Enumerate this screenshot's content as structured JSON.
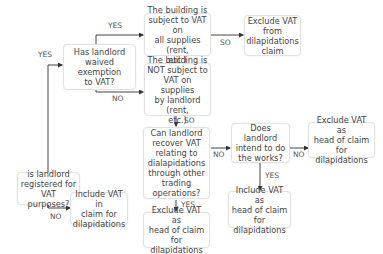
{
  "nodes": {
    "registered": "is landlord\nregistered for\nVAT purposes?",
    "waived": "Has landlord\nwaived exemption\nto VAT?",
    "subject": "The building is\nsubject to VAT on\nall supplies (rent,\netc.)",
    "exclude_from_claim": "Exclude VAT\nfrom\ndilapidations\nclaim",
    "not_subject": "The building is\nNOT subject to\nVAT on supplies\nby landlord (rent,\netc.)",
    "recover": "Can landlord\nrecover VAT\nrelating to\ndialapidations\nthrough other\ntrading\noperations?",
    "intend": "Does landlord\nintend to do\nthe works?",
    "exclude_head_no": "Exclude VAT as\nhead of claim\nfor dilapidations",
    "include_head": "Include VAT as\nhead of claim\nfor dilapidations",
    "exclude_head_yes": "Exclude VAT as\nhead of claim for\ndilapidations",
    "include_claim": "Include VAT in\nclaim for\ndilapidations"
  },
  "labels": {
    "yes_registered": "YES",
    "no_registered": "NO",
    "yes_waived": "YES",
    "no_waived": "NO",
    "so_subject": "SO",
    "so_not_subject": "SO",
    "no_recover": "NO",
    "yes_recover": "YES",
    "no_intend": "NO",
    "yes_intend": "YES"
  }
}
